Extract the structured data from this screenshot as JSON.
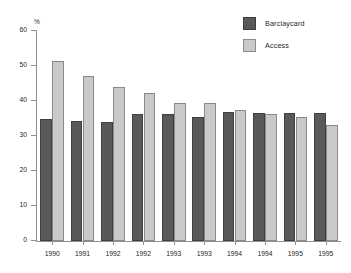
{
  "chart_data": {
    "type": "bar",
    "title": "",
    "xlabel": "",
    "ylabel": "%",
    "ylim": [
      0,
      60
    ],
    "yticks": [
      0,
      10,
      20,
      30,
      40,
      50,
      60
    ],
    "grid": false,
    "legend_position": "top-right",
    "categories": [
      "1990",
      "1991",
      "1992",
      "1992",
      "1993",
      "1993",
      "1994",
      "1994",
      "1995",
      "1995"
    ],
    "series": [
      {
        "name": "Barclaycard",
        "color": "#595959",
        "values": [
          35.0,
          34.2,
          34.1,
          36.2,
          36.2,
          35.5,
          36.8,
          36.5,
          36.5,
          36.6
        ]
      },
      {
        "name": "Access",
        "color": "#c9c9c9",
        "values": [
          51.3,
          47.1,
          44.1,
          42.2,
          39.4,
          39.4,
          37.3,
          36.4,
          35.5,
          33.1
        ]
      }
    ]
  }
}
